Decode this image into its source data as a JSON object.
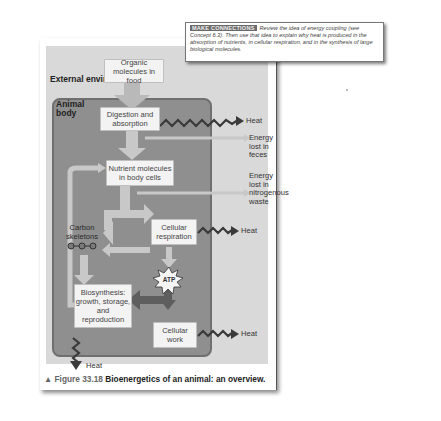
{
  "callout": {
    "tag": "MAKE CONNECTIONS",
    "text": "Review the idea of energy coupling (see Concept 6.3). Then use that idea to explain why heat is produced in the absorption of nutrients, in cellular respiration, and in the synthesis of large biological molecules."
  },
  "diagram": {
    "regions": {
      "external": "External environment",
      "animal_body": "Animal body"
    },
    "nodes": {
      "organic_molecules": "Organic molecules in food",
      "digestion": "Digestion and absorption",
      "nutrient_molecules": "Nutrient molecules in body cells",
      "carbon_skeletons": "Carbon skeletons",
      "cellular_respiration": "Cellular respiration",
      "atp": "ATP",
      "biosynthesis": "Biosynthesis: growth, storage, and reproduction",
      "cellular_work": "Cellular work"
    },
    "outputs": {
      "heat_digestion": "Heat",
      "energy_feces": "Energy lost in feces",
      "energy_nitrogenous": "Energy lost in nitrogenous waste",
      "heat_respiration": "Heat",
      "heat_work": "Heat",
      "heat_biosynthesis": "Heat"
    },
    "colors": {
      "figure_bg": "#d9d9d9",
      "body_fill": "#8f8f8f",
      "node_fill": "#f3f3f3",
      "arrow_light": "#c8c8c8",
      "heat_zigzag": "#3a3a3a"
    }
  },
  "caption": {
    "marker": "▲",
    "figure_number": "Figure 33.18",
    "title": "Bioenergetics of an animal: an overview."
  }
}
